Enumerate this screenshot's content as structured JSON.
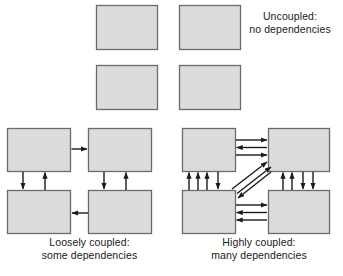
{
  "figure": {
    "style": {
      "box_fill": "#dcdcdc",
      "box_stroke": "#6b6b6b",
      "arrow_color": "#1a1a1a",
      "text_color": "#1a1a1a",
      "background": "#ffffff"
    }
  },
  "groups": {
    "uncoupled": {
      "caption_lines": [
        "Uncoupled:",
        "no dependencies"
      ],
      "boxes": [
        {
          "name": "uncoupled-box-top-left",
          "x": 96,
          "y": 5,
          "w": 62,
          "h": 45
        },
        {
          "name": "uncoupled-box-top-right",
          "x": 179,
          "y": 5,
          "w": 62,
          "h": 45
        },
        {
          "name": "uncoupled-box-bottom-left",
          "x": 96,
          "y": 65,
          "w": 62,
          "h": 45
        },
        {
          "name": "uncoupled-box-bottom-right",
          "x": 179,
          "y": 65,
          "w": 62,
          "h": 45
        }
      ],
      "arrow_count": 0
    },
    "loosely_coupled": {
      "caption_lines": [
        "Loosely coupled:",
        "some dependencies"
      ],
      "boxes": [
        {
          "name": "loose-box-top-left",
          "x": 7,
          "y": 128,
          "w": 64,
          "h": 44
        },
        {
          "name": "loose-box-top-right",
          "x": 88,
          "y": 128,
          "w": 64,
          "h": 44
        },
        {
          "name": "loose-box-bottom-left",
          "x": 7,
          "y": 190,
          "w": 64,
          "h": 44
        },
        {
          "name": "loose-box-bottom-right",
          "x": 88,
          "y": 190,
          "w": 64,
          "h": 44
        }
      ],
      "arrow_count": 5,
      "arrow_labels": [
        "top-left-to-top-right",
        "top-left-down-to-bottom-left",
        "bottom-left-up-to-top-left",
        "top-right-down-to-bottom-right",
        "bottom-right-up-to-top-right",
        "bottom-right-to-bottom-left"
      ]
    },
    "highly_coupled": {
      "caption_lines": [
        "Highly coupled:",
        "many dependencies"
      ],
      "boxes": [
        {
          "name": "high-box-top-left",
          "x": 182,
          "y": 128,
          "w": 54,
          "h": 44
        },
        {
          "name": "high-box-top-right",
          "x": 268,
          "y": 128,
          "w": 62,
          "h": 44
        },
        {
          "name": "high-box-bottom-left",
          "x": 182,
          "y": 190,
          "w": 54,
          "h": 44
        },
        {
          "name": "high-box-bottom-right",
          "x": 268,
          "y": 190,
          "w": 62,
          "h": 44
        }
      ],
      "arrow_count": 17,
      "arrow_groups": {
        "top_horizontal": {
          "right": 2,
          "left": 1
        },
        "bottom_horizontal": {
          "right": 1,
          "left": 2
        },
        "left_vertical": {
          "up": 3,
          "down": 1
        },
        "right_vertical": {
          "up": 2,
          "down": 2
        },
        "diagonal": {
          "up_right": 2,
          "down_left": 1
        }
      }
    }
  }
}
